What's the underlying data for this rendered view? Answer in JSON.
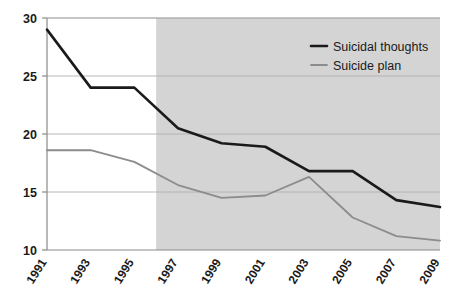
{
  "chart_data": {
    "type": "line",
    "title": "",
    "subtitle": "",
    "xlabel": "",
    "ylabel": "",
    "x": [
      1991,
      1993,
      1995,
      1997,
      1999,
      2001,
      2003,
      2005,
      2007,
      2009
    ],
    "categories": [
      "1991",
      "1993",
      "1995",
      "1997",
      "1999",
      "2001",
      "2003",
      "2005",
      "2007",
      "2009"
    ],
    "series": [
      {
        "name": "Suicidal thoughts",
        "color": "#1a1a1a",
        "values": [
          29.0,
          24.0,
          24.0,
          20.5,
          19.2,
          18.9,
          16.8,
          16.8,
          14.3,
          13.7
        ]
      },
      {
        "name": "Suicide plan",
        "color": "#8c8c8c",
        "values": [
          18.6,
          18.6,
          17.6,
          15.6,
          14.5,
          14.7,
          16.3,
          12.8,
          11.2,
          10.8
        ]
      }
    ],
    "xlim": [
      1991,
      2009
    ],
    "ylim": [
      10,
      30
    ],
    "yticks": [
      10,
      15,
      20,
      25,
      30
    ],
    "ytick_labels": [
      "10",
      "15",
      "20",
      "25",
      "30"
    ],
    "xticks": [
      1991,
      1993,
      1995,
      1997,
      1999,
      2001,
      2003,
      2005,
      2007,
      2009
    ],
    "grid": "horizontal",
    "legend_position": "top-right",
    "shaded_region": {
      "x_start": 1996,
      "x_end": 2009,
      "color": "#d4d4d4"
    },
    "plot_background": "#ffffff",
    "grid_color": "#b0b0b0",
    "axis_color": "#8a8a8a"
  },
  "legend": {
    "entries": [
      {
        "label": "Suicidal thoughts",
        "color": "#1a1a1a"
      },
      {
        "label": "Suicide plan",
        "color": "#8c8c8c"
      }
    ]
  }
}
